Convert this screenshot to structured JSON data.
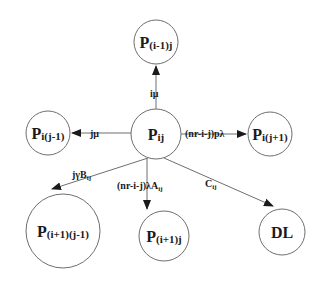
{
  "diagram": {
    "type": "state-transition",
    "nodes": [
      {
        "id": "center",
        "main": "P",
        "sub": "ij",
        "cx": 156,
        "cy": 134,
        "r": 25
      },
      {
        "id": "up",
        "main": "P",
        "sub": "(i-1)j",
        "cx": 156,
        "cy": 42,
        "r": 22
      },
      {
        "id": "left",
        "main": "P",
        "sub": "i(j-1)",
        "cx": 48,
        "cy": 133,
        "r": 22
      },
      {
        "id": "right",
        "main": "P",
        "sub": "i(j+1)",
        "cx": 270,
        "cy": 134,
        "r": 22
      },
      {
        "id": "lowleft",
        "main": "P",
        "sub": "(i+1)(j-1)",
        "cx": 63,
        "cy": 231,
        "r": 37
      },
      {
        "id": "down",
        "main": "P",
        "sub": "(i+1)j",
        "cx": 164,
        "cy": 236,
        "r": 25
      },
      {
        "id": "dl",
        "main": "DL",
        "sub": "",
        "cx": 282,
        "cy": 232,
        "r": 23
      }
    ],
    "edges": [
      {
        "id": "to-up",
        "label": "iμ"
      },
      {
        "id": "to-left",
        "label": "jμ"
      },
      {
        "id": "to-right",
        "label": "(nr-i-j)pλ"
      },
      {
        "id": "to-lowleft",
        "label": "jγB",
        "label_sub": "ij"
      },
      {
        "id": "to-down",
        "label": "(nr-i-j)λA",
        "label_sub": "ij"
      },
      {
        "id": "to-dl",
        "label": "C",
        "label_sub": "ij"
      }
    ]
  }
}
